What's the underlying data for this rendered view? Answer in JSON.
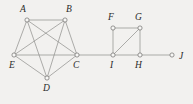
{
  "figure": {
    "background_color": "#f2f1ef",
    "edge_color": "#8d8c8a",
    "vertex_fill": "#f7f7f5",
    "vertex_stroke": "#6e6d6b",
    "label_color": "#2a2a2a"
  },
  "chart_data": {
    "type": "diagram",
    "title": "",
    "xlabel": "",
    "ylabel": "",
    "vertices": [
      {
        "id": "A",
        "label": "A",
        "x": 27,
        "y": 20,
        "label_x": 20,
        "label_y": 5
      },
      {
        "id": "B",
        "label": "B",
        "x": 65,
        "y": 20,
        "label_x": 66,
        "label_y": 5
      },
      {
        "id": "C",
        "label": "C",
        "x": 77,
        "y": 55,
        "label_x": 73,
        "label_y": 61
      },
      {
        "id": "D",
        "label": "D",
        "x": 47,
        "y": 78,
        "label_x": 43,
        "label_y": 84
      },
      {
        "id": "E",
        "label": "E",
        "x": 14,
        "y": 55,
        "label_x": 9,
        "label_y": 61
      },
      {
        "id": "F",
        "label": "F",
        "x": 113,
        "y": 28,
        "label_x": 108,
        "label_y": 13
      },
      {
        "id": "G",
        "label": "G",
        "x": 140,
        "y": 28,
        "label_x": 135,
        "label_y": 13
      },
      {
        "id": "H",
        "label": "H",
        "x": 140,
        "y": 55,
        "label_x": 135,
        "label_y": 61
      },
      {
        "id": "I",
        "label": "I",
        "x": 113,
        "y": 55,
        "label_x": 110,
        "label_y": 61
      },
      {
        "id": "J",
        "label": "J",
        "x": 172,
        "y": 55,
        "label_x": 179,
        "label_y": 52
      }
    ],
    "edges": [
      {
        "from": "A",
        "to": "B"
      },
      {
        "from": "A",
        "to": "C"
      },
      {
        "from": "A",
        "to": "D"
      },
      {
        "from": "A",
        "to": "E"
      },
      {
        "from": "B",
        "to": "C"
      },
      {
        "from": "B",
        "to": "D"
      },
      {
        "from": "B",
        "to": "E"
      },
      {
        "from": "C",
        "to": "D"
      },
      {
        "from": "C",
        "to": "E"
      },
      {
        "from": "D",
        "to": "E"
      },
      {
        "from": "C",
        "to": "I"
      },
      {
        "from": "F",
        "to": "G"
      },
      {
        "from": "F",
        "to": "I"
      },
      {
        "from": "G",
        "to": "H"
      },
      {
        "from": "G",
        "to": "I"
      },
      {
        "from": "H",
        "to": "I"
      },
      {
        "from": "H",
        "to": "J"
      }
    ],
    "vertex_radius": 2.1
  }
}
